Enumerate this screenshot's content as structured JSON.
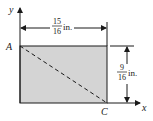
{
  "diagram": {
    "type": "rectangle-plate-dimension",
    "axes": {
      "x_label": "x",
      "y_label": "y"
    },
    "points": [
      {
        "name": "A",
        "position": "top-left corner"
      },
      {
        "name": "C",
        "position": "bottom-right corner"
      }
    ],
    "width_dimension": {
      "numerator": "15",
      "denominator": "16",
      "unit": "in."
    },
    "height_dimension": {
      "numerator": "9",
      "denominator": "16",
      "unit": "in."
    },
    "diagonal": {
      "from": "A",
      "to": "C",
      "style": "dashed"
    },
    "colors": {
      "fill": "#d4d4d4",
      "stroke": "#1a1a1a"
    }
  }
}
